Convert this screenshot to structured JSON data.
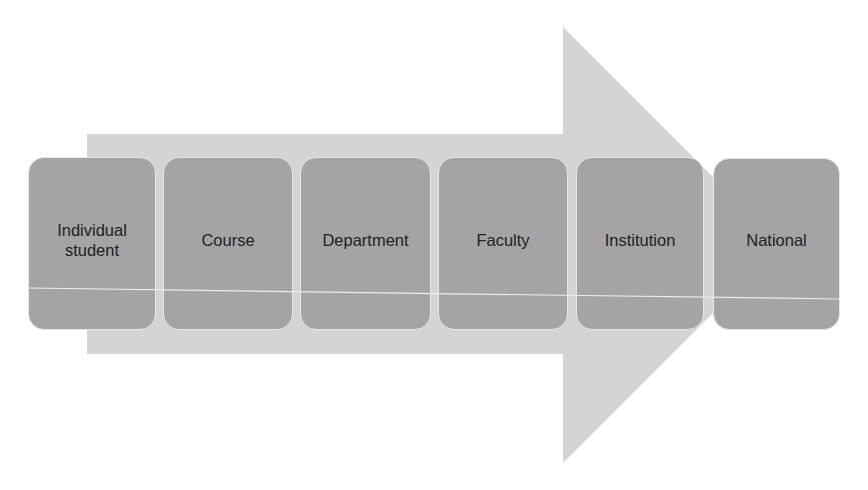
{
  "diagram": {
    "type": "process-arrow",
    "direction": "left-to-right",
    "colors": {
      "arrow_fill": "#d4d4d4",
      "box_fill": "#a4a4a4",
      "box_border": "#e6e6e6",
      "text": "#222222"
    },
    "stages": [
      {
        "label": "Individual student"
      },
      {
        "label": "Course"
      },
      {
        "label": "Department"
      },
      {
        "label": "Faculty"
      },
      {
        "label": "Institution"
      },
      {
        "label": "National"
      }
    ]
  }
}
